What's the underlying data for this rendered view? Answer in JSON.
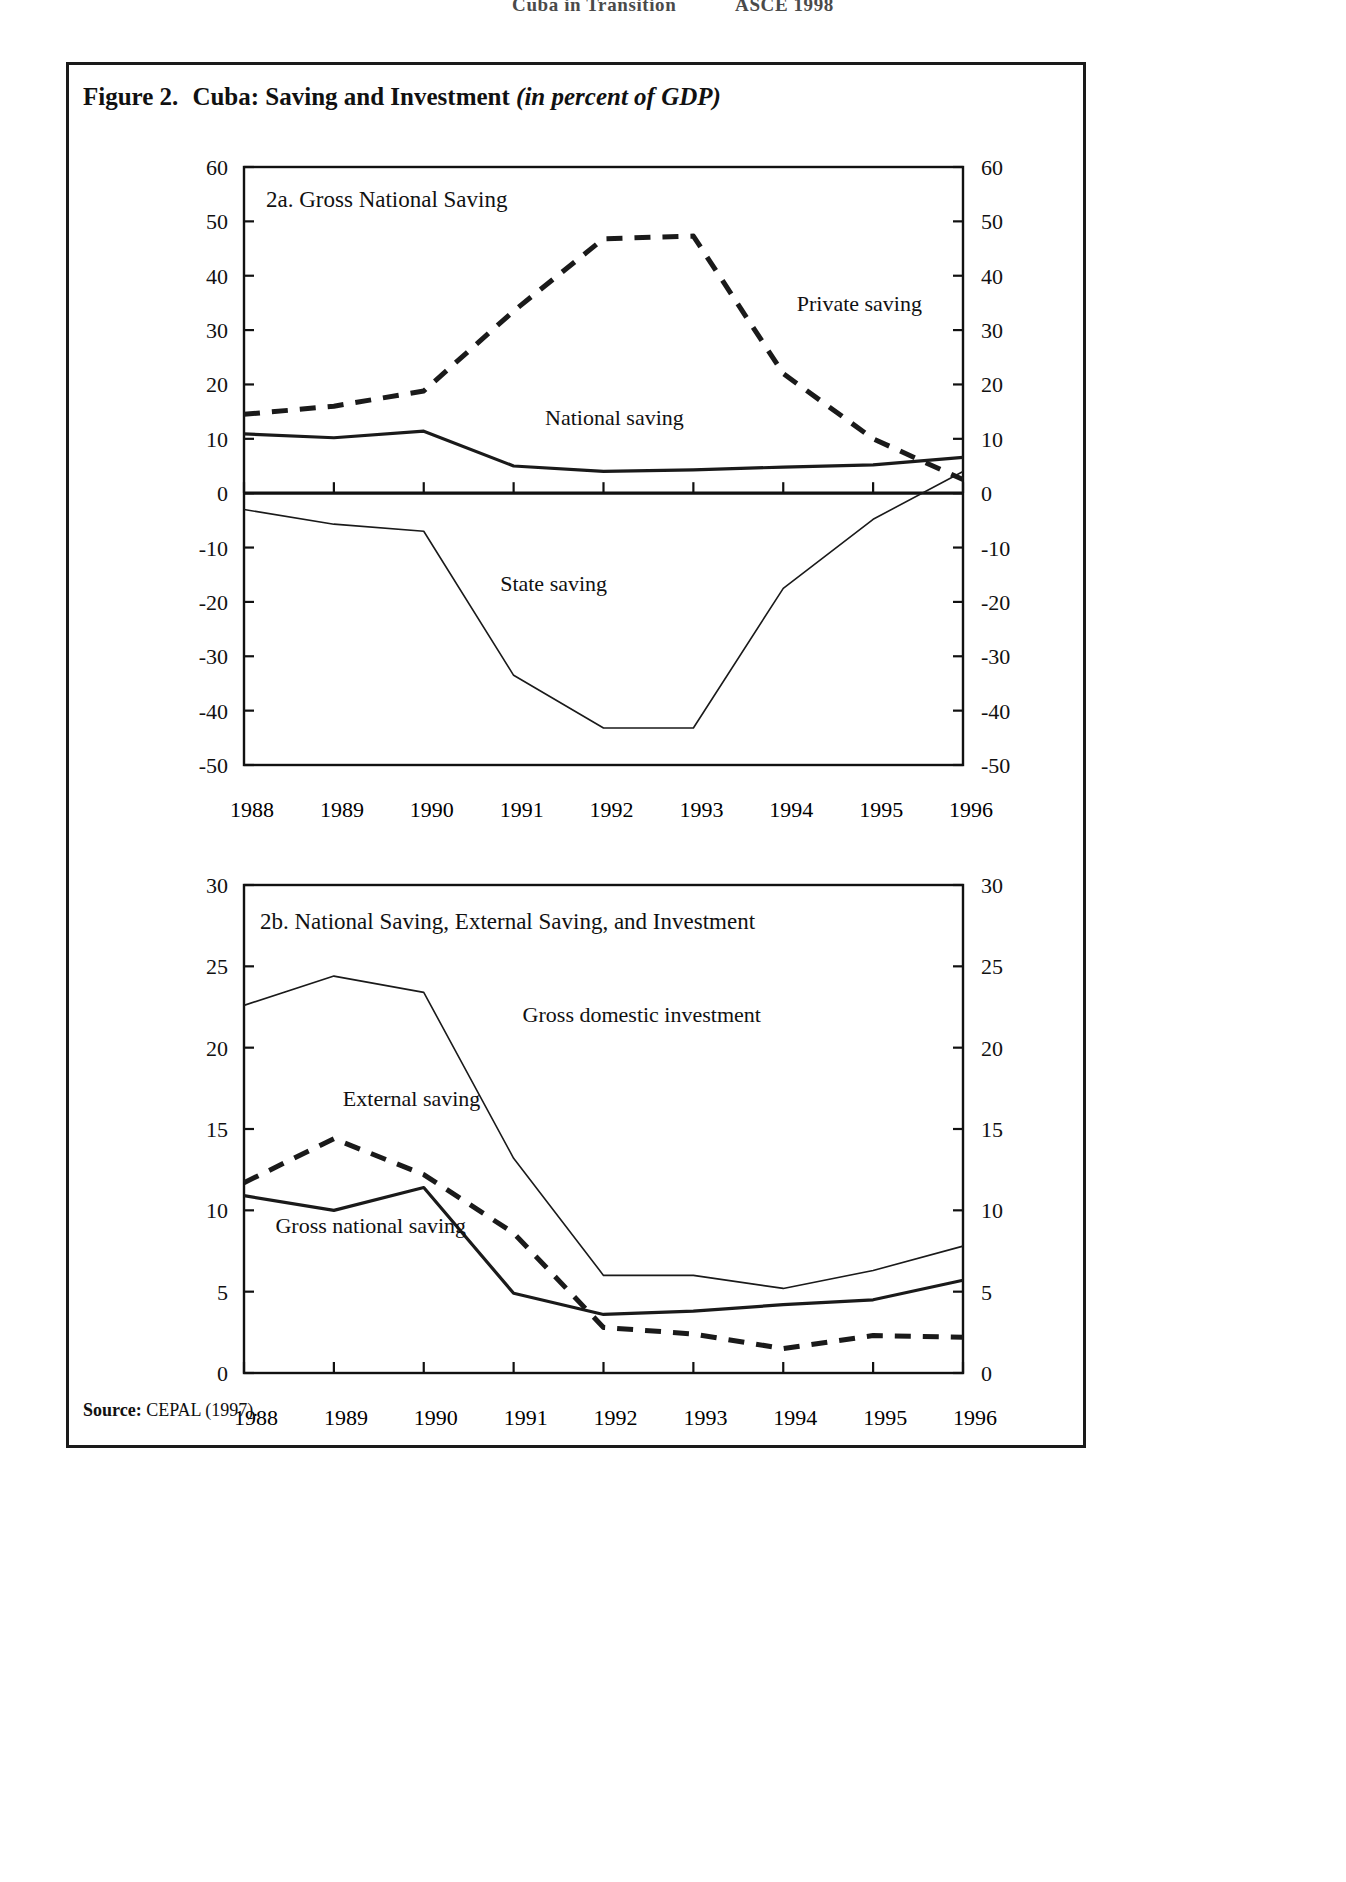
{
  "running_head": {
    "left": "Cuba in Transition",
    "right": "ASCE 1998"
  },
  "figure": {
    "number_label": "Figure 2.",
    "title_main": "Cuba: Saving and Investment",
    "title_italic": "(in percent of GDP)",
    "source_label": "Source:",
    "source_text": "CEPAL (1997)."
  },
  "chart_data": [
    {
      "id": "panel-2a",
      "type": "line",
      "title": "2a.  Gross National Saving",
      "xlabel": "",
      "ylabel": "",
      "x": [
        1988,
        1989,
        1990,
        1991,
        1992,
        1993,
        1994,
        1995,
        1996
      ],
      "categories": [
        "1988",
        "1989",
        "1990",
        "1991",
        "1992",
        "1993",
        "1994",
        "1995",
        "1996"
      ],
      "ylim": [
        -50,
        60
      ],
      "yticks": [
        -50,
        -40,
        -30,
        -20,
        -10,
        0,
        10,
        20,
        30,
        40,
        50,
        60
      ],
      "ytick_labels": [
        "-50",
        "-40",
        "-30",
        "-20",
        "-10",
        "0",
        "10",
        "20",
        "30",
        "40",
        "50",
        "60"
      ],
      "right_axis": true,
      "right_ytick_labels": [
        "-50",
        "-40",
        "-30",
        "-20",
        "-10",
        "0",
        "10",
        "20",
        "30",
        "40",
        "50",
        "60"
      ],
      "grid": false,
      "legend_position": "inline-annotation",
      "series": [
        {
          "name": "Private saving",
          "style": "dashed-heavy",
          "label_x": 1994.15,
          "label_y": 33.5,
          "values": [
            14.5,
            16.0,
            18.8,
            33.5,
            46.8,
            47.3,
            22.0,
            10.0,
            2.5
          ]
        },
        {
          "name": "National saving",
          "style": "solid-heavy",
          "label_x": 1991.35,
          "label_y": 12.5,
          "values": [
            10.9,
            10.2,
            11.4,
            5.0,
            4.0,
            4.3,
            4.8,
            5.2,
            6.6
          ]
        },
        {
          "name": "State saving",
          "style": "solid-thin",
          "label_x": 1990.85,
          "label_y": -18.0,
          "values": [
            -3.0,
            -5.7,
            -7.0,
            -33.5,
            -43.2,
            -43.2,
            -17.5,
            -4.8,
            4.0
          ]
        }
      ]
    },
    {
      "id": "panel-2b",
      "type": "line",
      "title": "2b. National Saving, External Saving, and Investment",
      "xlabel": "",
      "ylabel": "",
      "x": [
        1988,
        1989,
        1990,
        1991,
        1992,
        1993,
        1994,
        1995,
        1996
      ],
      "categories": [
        "1988",
        "1989",
        "1990",
        "1991",
        "1992",
        "1993",
        "1994",
        "1995",
        "1996"
      ],
      "ylim": [
        0,
        30
      ],
      "yticks": [
        0,
        5,
        10,
        15,
        20,
        25,
        30
      ],
      "ytick_labels": [
        "0",
        "5",
        "10",
        "15",
        "20",
        "25",
        "30"
      ],
      "right_axis": true,
      "right_ytick_labels": [
        "0",
        "5",
        "10",
        "15",
        "20",
        "25",
        "30"
      ],
      "grid": false,
      "legend_position": "inline-annotation",
      "series": [
        {
          "name": "Gross domestic investment",
          "style": "solid-thin",
          "label_x": 1991.1,
          "label_y": 21.6,
          "values": [
            22.6,
            24.4,
            23.4,
            13.2,
            6.0,
            6.0,
            5.2,
            6.3,
            7.8
          ]
        },
        {
          "name": "External saving",
          "style": "dashed-heavy",
          "label_x": 1989.1,
          "label_y": 16.4,
          "values": [
            11.7,
            14.4,
            12.2,
            8.6,
            2.8,
            2.4,
            1.5,
            2.3,
            2.2
          ]
        },
        {
          "name": "Gross national saving",
          "style": "solid-heavy",
          "label_x": 1988.35,
          "label_y": 8.6,
          "values": [
            10.9,
            10.0,
            11.4,
            4.9,
            3.6,
            3.8,
            4.2,
            4.5,
            5.7
          ]
        }
      ]
    }
  ]
}
